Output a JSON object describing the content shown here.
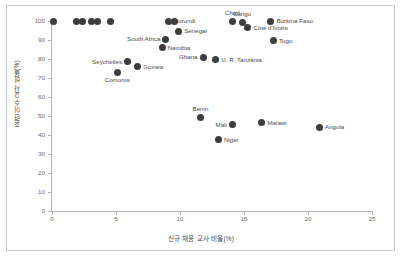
{
  "chart_data": {
    "type": "scatter",
    "title": "",
    "xlabel": "신규 채용 교사 비율(%)",
    "ylabel": "훈련 이수 교사 비율(%)",
    "xlim": [
      0,
      25
    ],
    "ylim": [
      0,
      100
    ],
    "xticks": [
      "0",
      "5",
      "10",
      "15",
      "20",
      "25"
    ],
    "yticks": [
      "0",
      "10",
      "20",
      "30",
      "40",
      "50",
      "60",
      "70",
      "80",
      "90",
      "100"
    ],
    "grid": false,
    "legend": "none",
    "marker_color": "#3d3d3d",
    "points": [
      {
        "label": "",
        "x": 0.15,
        "y": 100,
        "pos": "none"
      },
      {
        "label": "",
        "x": 1.9,
        "y": 100,
        "pos": "none"
      },
      {
        "label": "",
        "x": 2.35,
        "y": 100,
        "pos": "none"
      },
      {
        "label": "",
        "x": 3.1,
        "y": 100,
        "pos": "none"
      },
      {
        "label": "",
        "x": 3.55,
        "y": 100,
        "pos": "none"
      },
      {
        "label": "",
        "x": 4.6,
        "y": 100,
        "pos": "none"
      },
      {
        "label": "Burundi",
        "x": 9.1,
        "y": 100,
        "pos": "right"
      },
      {
        "label": "",
        "x": 9.55,
        "y": 100,
        "pos": "none"
      },
      {
        "label": "Chad",
        "x": 14.1,
        "y": 99.5,
        "pos": "top"
      },
      {
        "label": "Congo",
        "x": 14.85,
        "y": 99.2,
        "pos": "top"
      },
      {
        "label": "Burkina Faso",
        "x": 17.1,
        "y": 100,
        "pos": "right"
      },
      {
        "label": "Côte d'Ivoire",
        "x": 15.3,
        "y": 96.5,
        "pos": "right"
      },
      {
        "label": "Senegal",
        "x": 9.9,
        "y": 94.5,
        "pos": "right"
      },
      {
        "label": "South Africa",
        "x": 8.9,
        "y": 90.5,
        "pos": "left"
      },
      {
        "label": "Togo",
        "x": 17.3,
        "y": 89.5,
        "pos": "right"
      },
      {
        "label": "Namibia",
        "x": 8.6,
        "y": 86,
        "pos": "right"
      },
      {
        "label": "Ghana",
        "x": 11.8,
        "y": 81,
        "pos": "left"
      },
      {
        "label": "U. R. Tanzania",
        "x": 12.8,
        "y": 79.5,
        "pos": "right"
      },
      {
        "label": "Seychelles",
        "x": 5.9,
        "y": 78.6,
        "pos": "left"
      },
      {
        "label": "Guinea",
        "x": 6.7,
        "y": 75.8,
        "pos": "right"
      },
      {
        "label": "Comoros",
        "x": 5.1,
        "y": 73,
        "pos": "bottom"
      },
      {
        "label": "Benin",
        "x": 11.6,
        "y": 49.2,
        "pos": "top"
      },
      {
        "label": "Mali",
        "x": 14.1,
        "y": 45.5,
        "pos": "left"
      },
      {
        "label": "Malawi",
        "x": 16.4,
        "y": 46.5,
        "pos": "right"
      },
      {
        "label": "Angola",
        "x": 20.9,
        "y": 44.2,
        "pos": "right"
      },
      {
        "label": "Niger",
        "x": 13.0,
        "y": 37.5,
        "pos": "right"
      }
    ]
  }
}
